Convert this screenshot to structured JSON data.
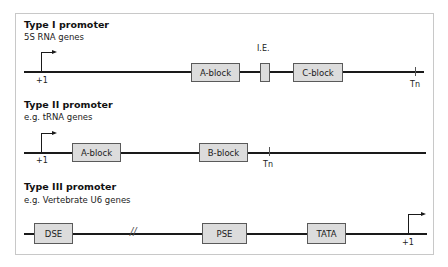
{
  "panels": {
    "type1": {
      "title": "Type I promoter",
      "subtitle": "5S RNA genes",
      "start_label": "+1",
      "blocks": [
        "A-block",
        "C-block"
      ],
      "ie_label": "I.E.",
      "terminator_label": "Tn"
    },
    "type2": {
      "title": "Type II promoter",
      "subtitle": "e.g. tRNA genes",
      "start_label": "+1",
      "blocks": [
        "A-block",
        "B-block"
      ],
      "terminator_label": "Tn"
    },
    "type3": {
      "title": "Type III promoter",
      "subtitle": "e.g. Vertebrate U6 genes",
      "start_label": "+1",
      "blocks": [
        "DSE",
        "PSE",
        "TATA"
      ],
      "break_symbol": "//"
    }
  },
  "colors": {
    "block_fill": "#dcdcdc",
    "block_border": "#5a5a5a",
    "line": "#1a1a1a",
    "frame": "#c8c8c8"
  }
}
